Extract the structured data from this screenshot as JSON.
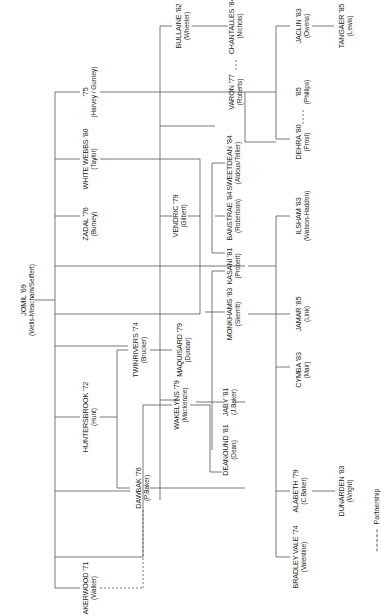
{
  "diagram": {
    "type": "family-tree",
    "orientation": "rotated-90-ccw",
    "line_color": "#555555",
    "root": {
      "name": "JOMIL '69",
      "owner": "(Wells-Meacham/Seiffert)"
    },
    "nodes": [
      {
        "id": "jomil",
        "name": "JOMIL '69",
        "owner": "(Wells-Meacham/Seiffert)"
      },
      {
        "id": "t75",
        "name": "'75",
        "owner": "(Harvey / Gurney)"
      },
      {
        "id": "whitewebbs",
        "name": "WHITE WEBBS '80",
        "owner": "(Taylor)"
      },
      {
        "id": "zadal",
        "name": "ZADAL '76",
        "owner": "(Burney)"
      },
      {
        "id": "huntersbrook",
        "name": "HUNTERSBROOK '72",
        "owner": "(Hunt)"
      },
      {
        "id": "akerwood",
        "name": "AKERWOOD '71",
        "owner": "(Walker)"
      },
      {
        "id": "twinrivers",
        "name": "TWINRIVERS '74",
        "owner": "(Brucker)"
      },
      {
        "id": "dawbak",
        "name": "DAWBAK '76",
        "owner": "(P.Baker)"
      },
      {
        "id": "bullaine",
        "name": "BULLAINE '82",
        "owner": "(Wheeler)"
      },
      {
        "id": "vendric",
        "name": "VENDRIC '79",
        "owner": "(Gilbert)"
      },
      {
        "id": "maquisard",
        "name": "MAQUISARD '79",
        "owner": "(Dunbar)"
      },
      {
        "id": "wakelyns",
        "name": "WAKELYNS '79",
        "owner": "(Mackenzie)"
      },
      {
        "id": "deanound",
        "name": "DEANOUND '81",
        "owner": "(Dean)"
      },
      {
        "id": "bradleyvale",
        "name": "BRADLEY VALE '74",
        "owner": "(Valentine)"
      },
      {
        "id": "chantalles",
        "name": "CHANTALLES '84",
        "owner": "(Nichols)"
      },
      {
        "id": "varon",
        "name": "VARON '77",
        "owner": "(Roberts)"
      },
      {
        "id": "sweetdean",
        "name": "SWEETDEAN '84",
        "owner": "(Aldous/Tellier)"
      },
      {
        "id": "banstrae",
        "name": "BANSTRAE '84",
        "owner": "(Robertson)"
      },
      {
        "id": "kasani",
        "name": "KASANI '81",
        "owner": "(Probert)"
      },
      {
        "id": "monkhams",
        "name": "MONKHAMS '83",
        "owner": "(Skerritt)"
      },
      {
        "id": "jaby",
        "name": "JABY '81",
        "owner": "(J.Baker)"
      },
      {
        "id": "alabeth",
        "name": "ALABETH '79",
        "owner": "(C.Baker)"
      },
      {
        "id": "jaclin",
        "name": "JACLIN '83",
        "owner": "(Owens)"
      },
      {
        "id": "t85",
        "name": "'85",
        "owner": "(Phillips)"
      },
      {
        "id": "dehra",
        "name": "DEHRA '80",
        "owner": "(Frost)"
      },
      {
        "id": "ilsham",
        "name": "ILSHAM '83",
        "owner": "(Watson-Haddon)"
      },
      {
        "id": "jamar",
        "name": "JAMAR '85",
        "owner": "(Link)"
      },
      {
        "id": "cymba",
        "name": "CYMBA '83",
        "owner": "(Mair)"
      },
      {
        "id": "dunarden",
        "name": "DUNARDEN '83",
        "owner": "(Wright)"
      },
      {
        "id": "tangaer",
        "name": "TANGAER '85",
        "owner": "(Lewis)"
      }
    ],
    "partnerships": [
      [
        "akerwood",
        "dawbak"
      ],
      [
        "bullaine",
        "chantalles"
      ],
      [
        "varon",
        "chantalles"
      ],
      [
        "dehra",
        "t85"
      ]
    ],
    "legend": {
      "label": "Partnership",
      "style": "dashed"
    }
  }
}
